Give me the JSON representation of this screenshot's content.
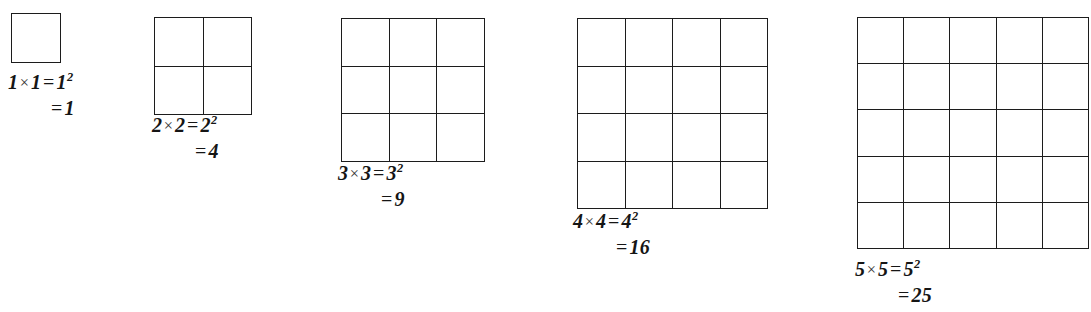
{
  "figure": {
    "background_color": "#ffffff",
    "line_color": "#1c1c1c",
    "text_color": "#151515",
    "times_symbol": "×",
    "equals_symbol": "=",
    "canvas": {
      "width": 1091,
      "height": 312
    }
  },
  "items": [
    {
      "n": 1,
      "rows": 1,
      "cols": 1,
      "cells": 1,
      "grid": {
        "left": 11,
        "top": 13,
        "width": 50,
        "height": 50,
        "cell": 50
      },
      "label": {
        "left": 8,
        "top": 70
      },
      "factor_a": "1",
      "factor_b": "1",
      "base": "1",
      "exponent": "2",
      "product": "1",
      "line1_prefix": "1",
      "line1_middle": "1",
      "line1_power_base": "1",
      "line2_result": "1"
    },
    {
      "n": 2,
      "rows": 2,
      "cols": 2,
      "cells": 4,
      "grid": {
        "left": 154,
        "top": 17,
        "width": 98,
        "height": 98,
        "cell": 49
      },
      "label": {
        "left": 152,
        "top": 113
      },
      "factor_a": "2",
      "factor_b": "2",
      "base": "2",
      "exponent": "2",
      "product": "4",
      "line1_prefix": "2",
      "line1_middle": "2",
      "line1_power_base": "2",
      "line2_result": "4"
    },
    {
      "n": 3,
      "rows": 3,
      "cols": 3,
      "cells": 9,
      "grid": {
        "left": 341,
        "top": 18,
        "width": 144,
        "height": 144,
        "cell": 48
      },
      "label": {
        "left": 338,
        "top": 161
      },
      "factor_a": "3",
      "factor_b": "3",
      "base": "3",
      "exponent": "2",
      "product": "9",
      "line1_prefix": "3",
      "line1_middle": "3",
      "line1_power_base": "3",
      "line2_result": "9"
    },
    {
      "n": 4,
      "rows": 4,
      "cols": 4,
      "cells": 16,
      "grid": {
        "left": 577,
        "top": 18,
        "width": 191,
        "height": 191,
        "cell": 47.75
      },
      "label": {
        "left": 573,
        "top": 209
      },
      "factor_a": "4",
      "factor_b": "4",
      "base": "4",
      "exponent": "2",
      "product": "16",
      "line1_prefix": "4",
      "line1_middle": "4",
      "line1_power_base": "4",
      "line2_result": "16"
    },
    {
      "n": 5,
      "rows": 5,
      "cols": 5,
      "cells": 25,
      "grid": {
        "left": 857,
        "top": 17,
        "width": 232,
        "height": 232,
        "cell": 46.4
      },
      "label": {
        "left": 855,
        "top": 257
      },
      "factor_a": "5",
      "factor_b": "5",
      "base": "5",
      "exponent": "2",
      "product": "25",
      "line1_prefix": "5",
      "line1_middle": "5",
      "line1_power_base": "5",
      "line2_result": "25",
      "note": "second line partially clipped by bottom image edge"
    }
  ]
}
